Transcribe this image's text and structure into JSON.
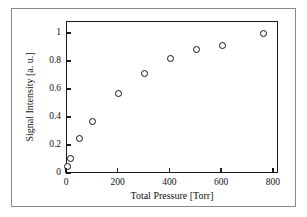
{
  "chart_data": {
    "type": "scatter",
    "title": "",
    "xlabel": "Total Pressure  [Torr]",
    "ylabel": "Signal Intensity  [a. u.]",
    "xlim": [
      0,
      820
    ],
    "ylim": [
      0,
      1.085
    ],
    "xticks": [
      0,
      200,
      400,
      600,
      800
    ],
    "xticklabels": [
      "0",
      "200",
      "400",
      "600",
      "800"
    ],
    "yticks": [
      0,
      0.2,
      0.4,
      0.6,
      0.8,
      1
    ],
    "yticklabels": [
      "0",
      "0.2",
      "0.4",
      "0.6",
      "0.8",
      "1"
    ],
    "grid": false,
    "legend": null,
    "marker": "open-circle",
    "marker_facecolor": "#ffffff",
    "marker_edgecolor": "#111111",
    "axis_color": "#1a1a1a",
    "background": "#ffffff",
    "x": [
      0,
      12,
      50,
      100,
      200,
      300,
      400,
      500,
      600,
      760
    ],
    "y": [
      0.05,
      0.11,
      0.25,
      0.375,
      0.575,
      0.715,
      0.825,
      0.89,
      0.92,
      1.0
    ],
    "points": [
      {
        "x": 0,
        "y": 0.05
      },
      {
        "x": 12,
        "y": 0.11
      },
      {
        "x": 50,
        "y": 0.25
      },
      {
        "x": 100,
        "y": 0.375
      },
      {
        "x": 200,
        "y": 0.575
      },
      {
        "x": 300,
        "y": 0.715
      },
      {
        "x": 400,
        "y": 0.825
      },
      {
        "x": 500,
        "y": 0.89
      },
      {
        "x": 600,
        "y": 0.92
      },
      {
        "x": 760,
        "y": 1.0
      }
    ]
  }
}
